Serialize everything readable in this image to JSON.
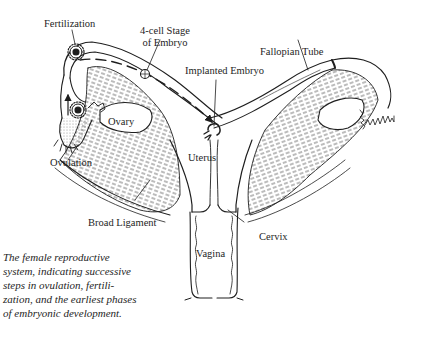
{
  "diagram": {
    "type": "anatomical-illustration",
    "subject": "female reproductive system",
    "labels": {
      "fertilization": "Fertilization",
      "four_cell_stage_line1": "4-cell Stage",
      "four_cell_stage_line2": "of Embryo",
      "implanted_embryo": "Implanted Embryo",
      "fallopian_tube": "Fallopian Tube",
      "ovary": "Ovary",
      "ovulation": "Ovulation",
      "uterus": "Uterus",
      "broad_ligament": "Broad Ligament",
      "cervix": "Cervix",
      "vagina": "Vagina"
    },
    "caption_lines": [
      "The female reproductive",
      "system, indicating successive",
      "steps in ovulation, fertili-",
      "zation, and the earliest phases",
      "of embryonic development."
    ],
    "colors": {
      "ink": "#1e1e1e",
      "background": "#ffffff"
    }
  }
}
